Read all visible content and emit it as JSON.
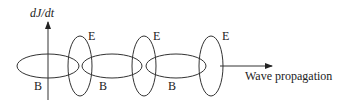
{
  "diagram": {
    "vertical_axis_label": "dJ/dt",
    "horizontal_arrow_label": "Wave propagation",
    "e_labels": [
      "E",
      "E",
      "E"
    ],
    "b_labels": [
      "B",
      "B",
      "B"
    ],
    "colors": {
      "stroke": "#333333",
      "background": "#ffffff"
    }
  }
}
